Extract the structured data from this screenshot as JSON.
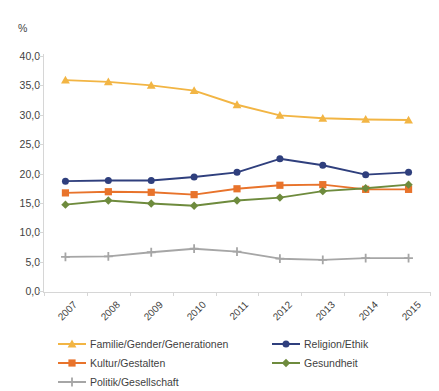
{
  "chart_data": {
    "type": "line",
    "title": "",
    "xlabel": "",
    "ylabel": "%",
    "ylim": [
      0,
      40
    ],
    "ytick_step": 5,
    "ytick_labels": [
      "0,0",
      "5,0",
      "10,0",
      "15,0",
      "20,0",
      "25,0",
      "30,0",
      "35,0",
      "40,0"
    ],
    "ytick_values": [
      0,
      5,
      10,
      15,
      20,
      25,
      30,
      35,
      40
    ],
    "grid": false,
    "legend_position": "bottom",
    "categories": [
      "2007",
      "2008",
      "2009",
      "2010",
      "2011",
      "2012",
      "2013",
      "2014",
      "2015"
    ],
    "series": [
      {
        "name": "Familie/Gender/Generationen",
        "color": "#f2b544",
        "marker": "triangle",
        "values": [
          35.9,
          35.6,
          35.0,
          34.1,
          31.7,
          29.9,
          29.4,
          29.2,
          29.1
        ]
      },
      {
        "name": "Religion/Ethik",
        "color": "#2f3f7d",
        "marker": "circle",
        "values": [
          18.7,
          18.8,
          18.8,
          19.4,
          20.2,
          22.5,
          21.4,
          19.8,
          20.2
        ]
      },
      {
        "name": "Kultur/Gestalten",
        "color": "#e8732b",
        "marker": "square",
        "values": [
          16.7,
          16.9,
          16.8,
          16.4,
          17.4,
          18.0,
          18.1,
          17.3,
          17.3
        ]
      },
      {
        "name": "Gesundheit",
        "color": "#6e8b3d",
        "marker": "diamond",
        "values": [
          14.7,
          15.4,
          14.9,
          14.5,
          15.4,
          15.9,
          17.0,
          17.5,
          18.1
        ]
      },
      {
        "name": "Politik/Gesellschaft",
        "color": "#a6a6a6",
        "marker": "cross",
        "values": [
          5.8,
          5.9,
          6.6,
          7.2,
          6.7,
          5.5,
          5.3,
          5.6,
          5.6
        ]
      }
    ]
  },
  "axis": {
    "y_unit_label": "%"
  },
  "cut_off_header": {
    "text": ""
  }
}
